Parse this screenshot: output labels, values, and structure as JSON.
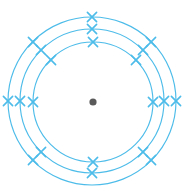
{
  "figure": {
    "type": "bohr-model",
    "background_color": "#ffffff",
    "width": 184,
    "height": 195
  },
  "nucleus": {
    "label": "nucleus",
    "cx": 93,
    "cy": 102,
    "r": 3.6,
    "color": "#5a5a5a"
  },
  "style": {
    "shell_color": "#4dbce9",
    "shell_stroke_width": 1.15,
    "electron_color": "#4dbce9",
    "electron_stroke_width": 1.6,
    "electron_arm": 4.6,
    "electron_glyph": "cross"
  },
  "shells": [
    {
      "name": "inner-shell",
      "index": 1,
      "cx": 93,
      "cy": 102,
      "r": 60,
      "electron_count": 6,
      "electron_angles": [
        270,
        315,
        225,
        0,
        180,
        90
      ]
    },
    {
      "name": "middle-shell",
      "index": 2,
      "cx": 92,
      "cy": 101,
      "r": 72,
      "electron_count": 8,
      "electron_angles": [
        270,
        315,
        225,
        0,
        180,
        45,
        135,
        90
      ]
    },
    {
      "name": "outer-shell",
      "index": 3,
      "cx": 92,
      "cy": 101,
      "r": 84,
      "electron_count": 6,
      "electron_angles": [
        270,
        315,
        225,
        0,
        180,
        90
      ]
    }
  ],
  "electrons": [
    {
      "id": "e-inner-top",
      "shell": 1,
      "x": 93,
      "y": 42
    },
    {
      "id": "e-inner-top-right",
      "shell": 1,
      "x": 136,
      "y": 60
    },
    {
      "id": "e-inner-top-left",
      "shell": 1,
      "x": 51,
      "y": 60
    },
    {
      "id": "e-inner-right",
      "shell": 1,
      "x": 153,
      "y": 102
    },
    {
      "id": "e-inner-left",
      "shell": 1,
      "x": 33,
      "y": 102
    },
    {
      "id": "e-inner-bottom",
      "shell": 1,
      "x": 93,
      "y": 162
    },
    {
      "id": "e-mid-top",
      "shell": 2,
      "x": 92,
      "y": 29
    },
    {
      "id": "e-mid-top-right",
      "shell": 2,
      "x": 143,
      "y": 50
    },
    {
      "id": "e-mid-top-left",
      "shell": 2,
      "x": 41,
      "y": 50
    },
    {
      "id": "e-mid-right",
      "shell": 2,
      "x": 164,
      "y": 101
    },
    {
      "id": "e-mid-left",
      "shell": 2,
      "x": 20,
      "y": 101
    },
    {
      "id": "e-mid-bottom-right",
      "shell": 2,
      "x": 143,
      "y": 152
    },
    {
      "id": "e-mid-bottom-left",
      "shell": 2,
      "x": 41,
      "y": 152
    },
    {
      "id": "e-mid-bottom",
      "shell": 2,
      "x": 92,
      "y": 173
    },
    {
      "id": "e-outer-top",
      "shell": 3,
      "x": 92,
      "y": 17
    },
    {
      "id": "e-outer-top-right",
      "shell": 3,
      "x": 151,
      "y": 42
    },
    {
      "id": "e-outer-top-left",
      "shell": 3,
      "x": 33,
      "y": 42
    },
    {
      "id": "e-outer-right",
      "shell": 3,
      "x": 176,
      "y": 101
    },
    {
      "id": "e-outer-left",
      "shell": 3,
      "x": 8,
      "y": 101
    },
    {
      "id": "e-outer-bottom-right",
      "shell": 3,
      "x": 151,
      "y": 160
    },
    {
      "id": "e-outer-bottom-left",
      "shell": 3,
      "x": 33,
      "y": 160
    }
  ]
}
